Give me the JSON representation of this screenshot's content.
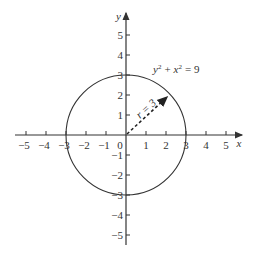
{
  "diagram": {
    "type": "coordinate-plane",
    "title": "",
    "equation": "y² + x² = 9",
    "equation_parts": {
      "y": "y",
      "x": "x",
      "exp": "2",
      "plus": "+",
      "eq": "= 9"
    },
    "radius_label": "r = 3",
    "x_axis_label": "x",
    "y_axis_label": "y",
    "origin_label": "0",
    "x_ticks": [
      "−5",
      "−4",
      "−3",
      "−2",
      "−1",
      "1",
      "2",
      "3",
      "4",
      "5"
    ],
    "y_ticks_pos": [
      "5",
      "4",
      "3",
      "2",
      "1"
    ],
    "y_ticks_neg": [
      "−1",
      "−2",
      "−3",
      "−4",
      "−5"
    ],
    "circle": {
      "center": [
        0,
        0
      ],
      "radius": 3
    },
    "radius_arrow": {
      "from": [
        0,
        0
      ],
      "to_angle_deg": 45
    },
    "colors": {
      "line": "#333333",
      "background": "#ffffff"
    }
  }
}
